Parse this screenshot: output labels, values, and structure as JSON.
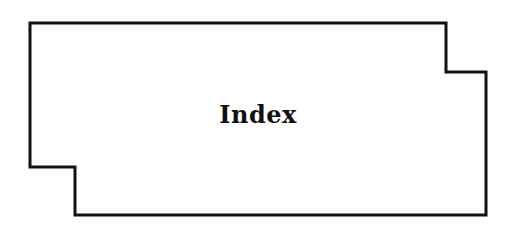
{
  "diagram": {
    "shape": {
      "type": "polygon",
      "points": [
        [
          30,
          23
        ],
        [
          446,
          23
        ],
        [
          446,
          72
        ],
        [
          486,
          72
        ],
        [
          486,
          215
        ],
        [
          75,
          215
        ],
        [
          75,
          167
        ],
        [
          30,
          167
        ]
      ],
      "stroke": "#111111",
      "stroke_width": 3,
      "fill": "#ffffff"
    },
    "label": "Index",
    "label_color": "#111111"
  }
}
